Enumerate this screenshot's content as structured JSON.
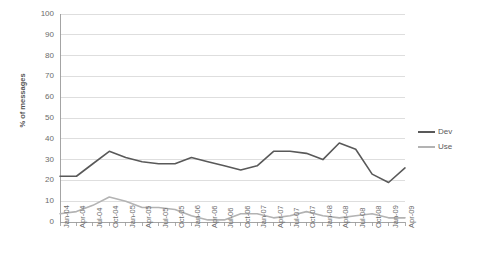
{
  "chart_data": {
    "type": "line",
    "title": "",
    "xlabel": "",
    "ylabel": "% of messages",
    "ylim": [
      0,
      100
    ],
    "ytick_step": 10,
    "yticks": [
      100,
      90,
      80,
      70,
      60,
      50,
      40,
      30,
      20,
      10,
      0
    ],
    "grid": true,
    "legend_position": "right",
    "categories": [
      "Jan-04",
      "Apr-04",
      "Jul-04",
      "Oct-04",
      "Jan-05",
      "Apr-05",
      "Jul-05",
      "Oct-05",
      "Jan-06",
      "Apr-06",
      "Jul-06",
      "Oct-06",
      "Jan-07",
      "Apr-07",
      "Jul-07",
      "Oct-07",
      "Jan-08",
      "Apr-08",
      "Jul-08",
      "Oct-08",
      "Jan-09",
      "Apr-09"
    ],
    "series": [
      {
        "name": "Dev",
        "color": "#595959",
        "values": [
          22,
          22,
          28,
          34,
          31,
          29,
          28,
          28,
          31,
          29,
          27,
          25,
          27,
          34,
          34,
          33,
          30,
          38,
          35,
          23,
          19,
          26
        ]
      },
      {
        "name": "Use",
        "color": "#b3b3b3",
        "values": [
          4,
          5,
          8,
          12,
          10,
          7,
          7,
          6,
          3,
          1,
          1,
          4,
          4,
          2,
          3,
          5,
          3,
          2,
          3,
          4,
          2,
          2
        ]
      }
    ],
    "series_dev_values_full": [
      22,
      22,
      28,
      34,
      31,
      29,
      28,
      28,
      31,
      29,
      27,
      25,
      27,
      34,
      34,
      33,
      30,
      38,
      35,
      23,
      19,
      26,
      23,
      30,
      31
    ],
    "series_use_values_full": [
      4,
      5,
      8,
      12,
      10,
      7,
      7,
      6,
      3,
      1,
      1,
      4,
      4,
      2,
      3,
      5,
      3,
      2,
      3,
      4,
      2,
      2
    ]
  },
  "legend": {
    "items": [
      {
        "label": "Dev",
        "color": "#595959"
      },
      {
        "label": "Use",
        "color": "#b3b3b3"
      }
    ]
  },
  "axes": {
    "y_title": "% of messages"
  }
}
